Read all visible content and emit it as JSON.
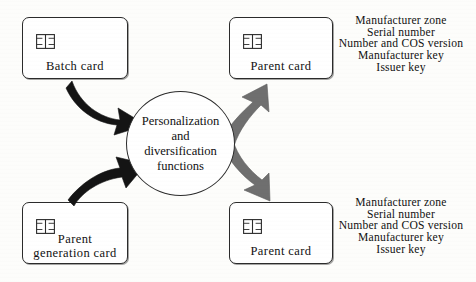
{
  "diagram": {
    "title": "Personalization and diversification functions",
    "colors": {
      "input_arrow": "#141414",
      "output_arrow": "#6f6f6f",
      "stroke": "#2b2b2b",
      "background": "#fdfdfb"
    },
    "process": {
      "name": "personalization-process",
      "lines": [
        "Personalization",
        "and",
        "diversification",
        "functions"
      ]
    },
    "cards": [
      {
        "id": "batch-card",
        "label_lines": [
          "Batch card"
        ],
        "icon": "smartcard-chip-icon",
        "role": "input"
      },
      {
        "id": "parent-generation-card",
        "label_lines": [
          "Parent",
          "generation  card"
        ],
        "icon": "smartcard-chip-icon",
        "role": "input"
      },
      {
        "id": "parent-card-top",
        "label_lines": [
          "Parent card"
        ],
        "icon": "smartcard-chip-icon",
        "role": "output"
      },
      {
        "id": "parent-card-bottom",
        "label_lines": [
          "Parent card"
        ],
        "icon": "smartcard-chip-icon",
        "role": "output"
      }
    ],
    "attribute_blocks": [
      {
        "id": "attributes-top",
        "items": [
          "Manufacturer  zone",
          "Serial  number",
          "Number  and  COS  version",
          "Manufacturer  key",
          "Issuer  key"
        ]
      },
      {
        "id": "attributes-bottom",
        "items": [
          "Manufacturer  zone",
          "Serial  number",
          "Number  and  COS  version",
          "Manufacturer  key",
          "Issuer  key"
        ]
      }
    ],
    "arrows": [
      {
        "id": "arrow-batch-to-process",
        "color": "#141414",
        "direction": "down-right"
      },
      {
        "id": "arrow-parent-generation-to-process",
        "color": "#141414",
        "direction": "up-right"
      },
      {
        "id": "arrow-process-to-parent-top",
        "color": "#6f6f6f",
        "direction": "up-right"
      },
      {
        "id": "arrow-process-to-parent-bottom",
        "color": "#6f6f6f",
        "direction": "down-right"
      }
    ]
  }
}
